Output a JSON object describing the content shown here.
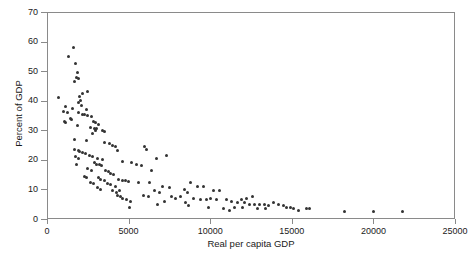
{
  "chart_data": {
    "type": "scatter",
    "title": "",
    "xlabel": "Real per capita GDP",
    "ylabel": "Percent of GDP",
    "xlim": [
      0,
      25000
    ],
    "ylim": [
      0,
      70
    ],
    "xticks": [
      0,
      5000,
      10000,
      15000,
      20000,
      25000
    ],
    "xtick_labels": [
      "0",
      "5000",
      "10000",
      "15000",
      "20000",
      "25000"
    ],
    "yticks": [
      0,
      10,
      20,
      30,
      40,
      50,
      60,
      70
    ],
    "ytick_labels": [
      "0",
      "10",
      "20",
      "30",
      "40",
      "50",
      "60",
      "70"
    ],
    "grid": false,
    "legend": null,
    "marker_color": "#333333",
    "axis_color": "#8a8a8a",
    "series": [
      {
        "name": "countries",
        "points": [
          [
            1600,
            58.0
          ],
          [
            1300,
            55.0
          ],
          [
            1750,
            52.5
          ],
          [
            1850,
            49.5
          ],
          [
            1800,
            48.0
          ],
          [
            1900,
            47.5
          ],
          [
            1700,
            46.5
          ],
          [
            2500,
            43.0
          ],
          [
            2200,
            42.5
          ],
          [
            2000,
            41.5
          ],
          [
            700,
            41.0
          ],
          [
            2050,
            40.0
          ],
          [
            1900,
            39.5
          ],
          [
            2100,
            38.5
          ],
          [
            1150,
            38.0
          ],
          [
            1550,
            37.5
          ],
          [
            2400,
            37.0
          ],
          [
            1000,
            36.5
          ],
          [
            1250,
            36.0
          ],
          [
            1900,
            36.0
          ],
          [
            2150,
            35.5
          ],
          [
            2300,
            35.5
          ],
          [
            2500,
            35.0
          ],
          [
            2700,
            34.5
          ],
          [
            1450,
            34.0
          ],
          [
            1500,
            33.5
          ],
          [
            1100,
            33.0
          ],
          [
            1150,
            32.5
          ],
          [
            2850,
            33.0
          ],
          [
            3000,
            32.5
          ],
          [
            3150,
            32.0
          ],
          [
            1850,
            31.5
          ],
          [
            2650,
            31.0
          ],
          [
            2900,
            30.5
          ],
          [
            3050,
            30.5
          ],
          [
            2950,
            30.0
          ],
          [
            3400,
            30.0
          ],
          [
            3550,
            29.5
          ],
          [
            2800,
            29.0
          ],
          [
            1700,
            27.0
          ],
          [
            2400,
            26.5
          ],
          [
            3500,
            26.0
          ],
          [
            3800,
            25.5
          ],
          [
            4000,
            25.0
          ],
          [
            4200,
            24.5
          ],
          [
            6000,
            24.5
          ],
          [
            6100,
            23.5
          ],
          [
            4300,
            23.0
          ],
          [
            1700,
            23.5
          ],
          [
            1900,
            23.0
          ],
          [
            2000,
            22.8
          ],
          [
            2150,
            22.5
          ],
          [
            2350,
            22.0
          ],
          [
            2600,
            21.5
          ],
          [
            2800,
            21.0
          ],
          [
            1750,
            21.0
          ],
          [
            1950,
            20.5
          ],
          [
            3100,
            20.5
          ],
          [
            3400,
            20.0
          ],
          [
            4600,
            19.5
          ],
          [
            5200,
            19.0
          ],
          [
            7300,
            21.5
          ],
          [
            6700,
            20.5
          ],
          [
            2900,
            19.0
          ],
          [
            3050,
            18.5
          ],
          [
            3200,
            18.5
          ],
          [
            3350,
            18.0
          ],
          [
            5500,
            18.5
          ],
          [
            5800,
            18.0
          ],
          [
            1800,
            18.5
          ],
          [
            2500,
            17.0
          ],
          [
            2750,
            16.5
          ],
          [
            3600,
            16.5
          ],
          [
            3750,
            16.0
          ],
          [
            3900,
            15.5
          ],
          [
            4100,
            15.0
          ],
          [
            6400,
            16.5
          ],
          [
            2300,
            14.5
          ],
          [
            2450,
            14.0
          ],
          [
            3150,
            14.0
          ],
          [
            3300,
            13.5
          ],
          [
            3500,
            13.0
          ],
          [
            4400,
            13.5
          ],
          [
            4600,
            13.0
          ],
          [
            4800,
            13.0
          ],
          [
            5000,
            12.8
          ],
          [
            5600,
            12.5
          ],
          [
            6300,
            12.5
          ],
          [
            8800,
            12.5
          ],
          [
            2650,
            12.5
          ],
          [
            2850,
            12.0
          ],
          [
            3700,
            12.0
          ],
          [
            3900,
            11.5
          ],
          [
            4200,
            11.0
          ],
          [
            7100,
            11.0
          ],
          [
            7500,
            10.5
          ],
          [
            9200,
            11.0
          ],
          [
            9600,
            11.0
          ],
          [
            3100,
            10.5
          ],
          [
            3300,
            10.0
          ],
          [
            4000,
            9.5
          ],
          [
            4250,
            9.0
          ],
          [
            4450,
            9.5
          ],
          [
            6600,
            9.5
          ],
          [
            6900,
            9.0
          ],
          [
            8400,
            10.0
          ],
          [
            8600,
            9.0
          ],
          [
            10200,
            9.5
          ],
          [
            10600,
            9.5
          ],
          [
            4350,
            8.0
          ],
          [
            4500,
            7.5
          ],
          [
            4650,
            7.0
          ],
          [
            5900,
            8.0
          ],
          [
            6200,
            7.5
          ],
          [
            7600,
            7.5
          ],
          [
            7900,
            7.0
          ],
          [
            8200,
            7.5
          ],
          [
            9000,
            7.0
          ],
          [
            9400,
            6.5
          ],
          [
            10000,
            7.0
          ],
          [
            10400,
            6.5
          ],
          [
            11000,
            6.5
          ],
          [
            11300,
            6.0
          ],
          [
            4900,
            6.5
          ],
          [
            5100,
            6.0
          ],
          [
            7200,
            6.0
          ],
          [
            8500,
            5.5
          ],
          [
            9800,
            6.5
          ],
          [
            11700,
            5.5
          ],
          [
            12100,
            5.5
          ],
          [
            12400,
            5.0
          ],
          [
            12000,
            4.0
          ],
          [
            5050,
            4.0
          ],
          [
            6800,
            5.0
          ],
          [
            8700,
            4.5
          ],
          [
            11500,
            4.0
          ],
          [
            12700,
            5.0
          ],
          [
            13000,
            5.0
          ],
          [
            13300,
            5.0
          ],
          [
            13600,
            4.5
          ],
          [
            13900,
            5.5
          ],
          [
            14200,
            5.0
          ],
          [
            14500,
            4.5
          ],
          [
            12900,
            3.5
          ],
          [
            13400,
            3.5
          ],
          [
            14700,
            4.0
          ],
          [
            14900,
            4.0
          ],
          [
            15100,
            3.5
          ],
          [
            15400,
            3.0
          ],
          [
            15900,
            3.5
          ],
          [
            16100,
            3.5
          ],
          [
            11900,
            6.5
          ],
          [
            12200,
            7.0
          ],
          [
            12600,
            7.5
          ],
          [
            18200,
            2.5
          ],
          [
            20000,
            2.5
          ],
          [
            21800,
            2.5
          ],
          [
            10800,
            3.5
          ],
          [
            11200,
            3.0
          ],
          [
            9900,
            4.0
          ]
        ]
      }
    ]
  },
  "axes": {
    "x_axis_name": "x-axis",
    "y_axis_name": "y-axis"
  }
}
